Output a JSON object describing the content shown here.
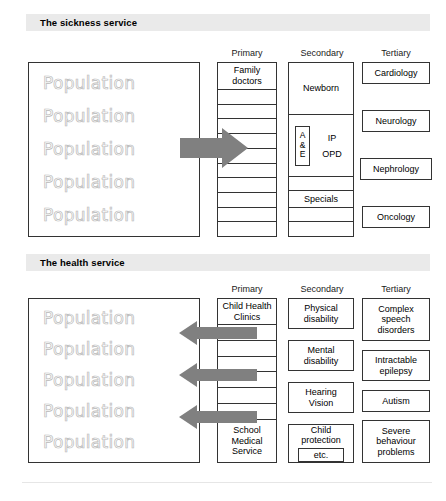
{
  "colors": {
    "title_band_bg": "#eaeaea",
    "arrow_gray": "#808080",
    "population_outline": "#b9b9b9",
    "border": "#333333"
  },
  "sections": [
    {
      "id": "sickness",
      "title": "The sickness service",
      "column_headers": {
        "primary": "Primary",
        "secondary": "Secondary",
        "tertiary": "Tertiary"
      },
      "population": {
        "word": "Population",
        "rows": [
          "Population",
          "Population",
          "Population",
          "Population",
          "Population"
        ]
      },
      "primary": {
        "top_label_line1": "Family",
        "top_label_line2": "doctors",
        "rung_count": 10
      },
      "secondary": {
        "newborn": "Newborn",
        "ae_line1": "A",
        "ae_line2": "&",
        "ae_line3": "E",
        "ip": "IP",
        "opd": "OPD",
        "specials": "Specials"
      },
      "tertiary": [
        "Cardiology",
        "Neurology",
        "Nephrology",
        "Oncology"
      ],
      "arrow_direction": "right",
      "arrow_count": 1
    },
    {
      "id": "health",
      "title": "The health service",
      "column_headers": {
        "primary": "Primary",
        "secondary": "Secondary",
        "tertiary": "Tertiary"
      },
      "population": {
        "word": "Population",
        "rows": [
          "Population",
          "Population",
          "Population",
          "Population",
          "Population"
        ]
      },
      "primary": {
        "top_label_line1": "Child Health",
        "top_label_line2": "Clinics",
        "bottom_label_line1": "School",
        "bottom_label_line2": "Medical",
        "bottom_label_line3": "Service",
        "rung_count": 6
      },
      "secondary": [
        {
          "line1": "Physical",
          "line2": "disability"
        },
        {
          "line1": "Mental",
          "line2": "disability"
        },
        {
          "line1": "Hearing",
          "line2": "Vision"
        },
        {
          "line1": "Child",
          "line2": "protection",
          "inner_box": "etc."
        }
      ],
      "tertiary": [
        {
          "line1": "Complex",
          "line2": "speech",
          "line3": "disorders"
        },
        {
          "line1": "Intractable",
          "line2": "epilepsy"
        },
        {
          "line1": "Autism"
        },
        {
          "line1": "Severe",
          "line2": "behaviour",
          "line3": "problems"
        }
      ],
      "arrow_direction": "left",
      "arrow_count": 3
    }
  ]
}
